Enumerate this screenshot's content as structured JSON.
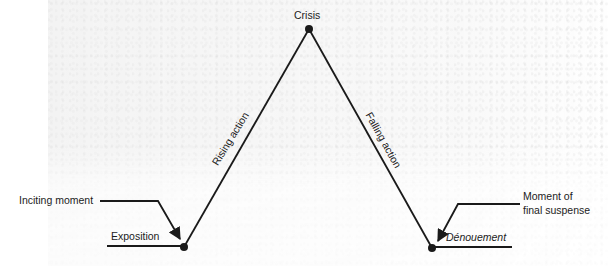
{
  "diagram": {
    "type": "freytag-pyramid",
    "line_color": "#1a1a1a",
    "points": {
      "exposition": {
        "x": 184,
        "y": 247,
        "label": "Exposition"
      },
      "crisis": {
        "x": 309,
        "y": 29,
        "label": "Crisis"
      },
      "denouement": {
        "x": 432,
        "y": 248,
        "label": "Dénouement"
      }
    },
    "slopes": {
      "rising": {
        "label": "Rising action"
      },
      "falling": {
        "label": "Falling action"
      }
    },
    "callouts": {
      "inciting_moment": {
        "label": "Inciting moment"
      },
      "final_suspense": {
        "line1": "Moment of",
        "line2": "final suspense"
      }
    }
  }
}
